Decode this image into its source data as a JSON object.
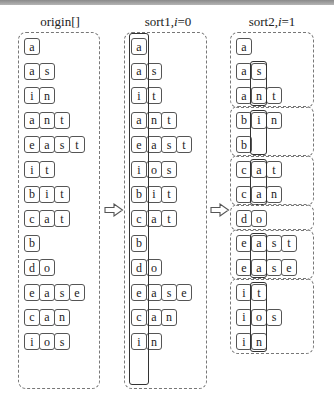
{
  "titles": {
    "origin": "origin[]",
    "sort1_prefix": "sort1,",
    "sort1_var": "i",
    "sort1_suffix": "=0",
    "sort2_prefix": "sort2,",
    "sort2_var": "i",
    "sort2_suffix": "=1"
  },
  "origin": [
    "a",
    "as",
    "in",
    "ant",
    "east",
    "it",
    "bit",
    "cat",
    "b",
    "do",
    "ease",
    "can",
    "ios"
  ],
  "sort1": [
    "a",
    "as",
    "it",
    "ant",
    "east",
    "ios",
    "bit",
    "cat",
    "b",
    "do",
    "ease",
    "can",
    "in"
  ],
  "sort2_groups": [
    [
      "a",
      "as",
      "ant"
    ],
    [
      "bin",
      "b"
    ],
    [
      "cat",
      "can"
    ],
    [
      "do"
    ],
    [
      "east",
      "ease"
    ],
    [
      "it",
      "ios",
      "in"
    ]
  ],
  "arrows": [
    "right-arrow",
    "right-arrow"
  ],
  "colors": {
    "border": "#555555",
    "dashed": "#777777",
    "highlight": "#333333"
  }
}
